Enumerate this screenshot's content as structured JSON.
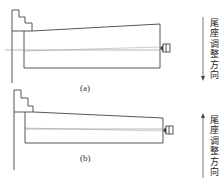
{
  "figure": {
    "panels": [
      {
        "id": "a",
        "caption": "(a)",
        "direction_label": "尾座调整方向",
        "arrow_direction": "down"
      },
      {
        "id": "b",
        "caption": "(b)",
        "direction_label": "尾座调整方向",
        "arrow_direction": "up"
      }
    ],
    "colors": {
      "line": "#444444",
      "axis": "#888888",
      "background": "#ffffff"
    }
  }
}
